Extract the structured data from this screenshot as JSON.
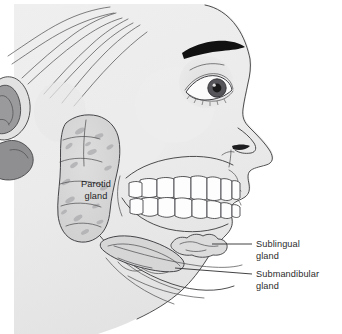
{
  "figure": {
    "background_color": "#ffffff",
    "width": 342,
    "height": 334
  },
  "colors": {
    "background": "#ffffff",
    "skin_light": "#f1f1f1",
    "skin_shade": "#e4e4e4",
    "skin_shade_deep": "#d5d5d6",
    "gland_fill": "#d6d6d7",
    "gland_speckle": "#a9a9ab",
    "tooth_fill": "#fdfdfd",
    "outline": "#3a3a3c",
    "eyebrow": "#111111",
    "iris": "#4d4d50",
    "pupil": "#1a1a1a",
    "ear_shadow": "#8e8e91",
    "text": "#2b2b2b"
  },
  "labels": {
    "parotid": {
      "line1": "Parotid",
      "line2": "gland",
      "x": 96,
      "y1": 187,
      "y2": 199,
      "placement": "inside-gland"
    },
    "sublingual": {
      "line1": "Sublingual",
      "line2": "gland",
      "x": 256,
      "y1": 247,
      "y2": 259,
      "leader_from_x": 212,
      "leader_to_x": 252,
      "leader_y": 244,
      "placement": "right-external"
    },
    "submandibular": {
      "line1": "Submandibular",
      "line2": "gland",
      "x": 256,
      "y1": 277,
      "y2": 289,
      "leader_from_x": 175,
      "leader_to_x": 252,
      "leader_y": 274,
      "placement": "right-external"
    }
  },
  "anatomy": {
    "structures": [
      "head-profile",
      "scalp-contour-lines",
      "ear",
      "eyebrow",
      "eye",
      "nose",
      "lips",
      "upper-teeth",
      "lower-teeth",
      "mandible",
      "parotid-gland",
      "sublingual-gland",
      "submandibular-gland",
      "chin",
      "neck"
    ],
    "tooth_counts": {
      "upper": 8,
      "lower": 8
    }
  }
}
